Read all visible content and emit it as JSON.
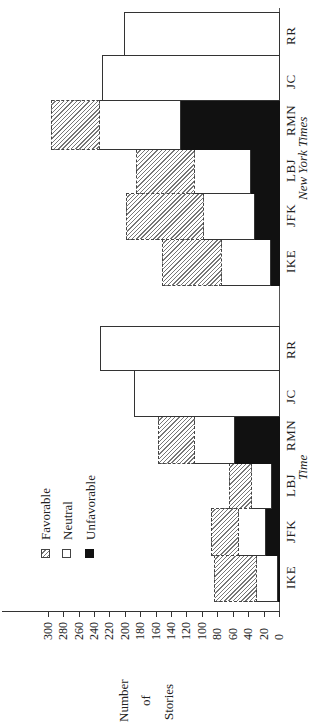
{
  "chart_data": {
    "type": "bar",
    "orientation": "rotated-horizontal-stacked",
    "title": "",
    "ylabel": "Number of Stories",
    "xlabel": "",
    "ylim": [
      0,
      300
    ],
    "yticks": [
      0,
      20,
      40,
      60,
      80,
      100,
      120,
      140,
      160,
      180,
      200,
      220,
      240,
      260,
      280,
      300
    ],
    "legend": [
      "Favorable",
      "Neutral",
      "Unfavorable"
    ],
    "categories": [
      "IKE",
      "JFK",
      "LBJ",
      "RMN",
      "JC",
      "RR"
    ],
    "groups": [
      {
        "name": "Time",
        "series": [
          {
            "name": "Unfavorable",
            "values": [
              3,
              18,
              11,
              59,
              0,
              0
            ]
          },
          {
            "name": "Neutral",
            "values": [
              27,
              35,
              25,
              51,
              188,
              232
            ]
          },
          {
            "name": "Favorable",
            "values": [
              54,
              35,
              29,
              47,
              0,
              0
            ]
          }
        ],
        "totals": [
          84,
          88,
          65,
          157,
          188,
          232
        ]
      },
      {
        "name": "New York Times",
        "series": [
          {
            "name": "Unfavorable",
            "values": [
              12,
              33,
              38,
              128,
              0,
              0
            ]
          },
          {
            "name": "Neutral",
            "values": [
              63,
              66,
              72,
              105,
              230,
              201
            ]
          },
          {
            "name": "Favorable",
            "values": [
              77,
              99,
              76,
              63,
              0,
              0
            ]
          }
        ],
        "totals": [
          152,
          198,
          186,
          296,
          230,
          201
        ]
      }
    ]
  },
  "labels": {
    "axis_title_line1": "Number",
    "axis_title_line2": "of",
    "axis_title_line3": "Stories",
    "group_time": "Time",
    "group_nyt": "New York Times",
    "legend_favorable": "Favorable",
    "legend_neutral": "Neutral",
    "legend_unfavorable": "Unfavorable"
  },
  "colors": {
    "favorable_hatch": "#777777",
    "neutral": "#ffffff",
    "unfavorable": "#111111",
    "outline": "#333333"
  }
}
